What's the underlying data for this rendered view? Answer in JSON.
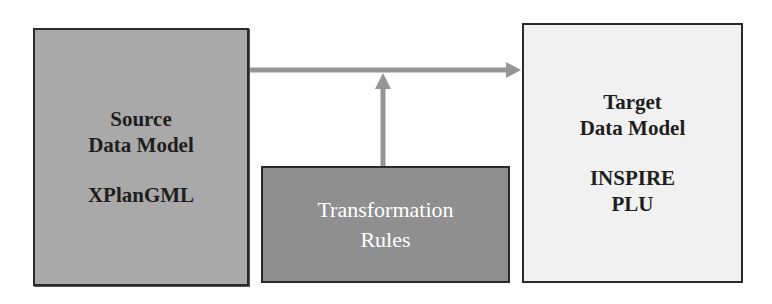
{
  "diagram": {
    "source": {
      "title_lines": [
        "Source",
        "Data Model"
      ],
      "name": "XPlanGML"
    },
    "target": {
      "title_lines": [
        "Target",
        "Data Model"
      ],
      "name_lines": [
        "INSPIRE",
        "PLU"
      ]
    },
    "rules": {
      "title_lines": [
        "Transformation",
        "Rules"
      ]
    },
    "connections": [
      {
        "from": "source",
        "to": "target",
        "type": "arrow"
      },
      {
        "from": "rules",
        "to": "source-target-arrow",
        "type": "arrow"
      }
    ],
    "colors": {
      "source_fill": "#a9a9a9",
      "target_fill": "#f1f1f1",
      "rules_fill": "#8f8f8f",
      "arrow": "#959595",
      "border": "#2a2a2a"
    }
  }
}
